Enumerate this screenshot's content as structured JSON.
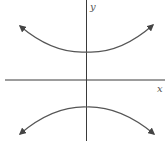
{
  "diagram": {
    "type": "hyperbola",
    "orientation": "vertical-transverse-axis",
    "axes": {
      "x_label": "x",
      "y_label": "y"
    },
    "branches": [
      {
        "name": "upper",
        "vertex": "above x-axis on y-axis",
        "opens": "up",
        "arrows": [
          "upper-left",
          "upper-right"
        ]
      },
      {
        "name": "lower",
        "vertex": "below x-axis on y-axis",
        "opens": "down",
        "arrows": [
          "lower-left",
          "lower-right"
        ]
      }
    ],
    "colors": {
      "axis": "#3a3a3a",
      "curve": "#555555",
      "background": "#ffffff"
    }
  }
}
